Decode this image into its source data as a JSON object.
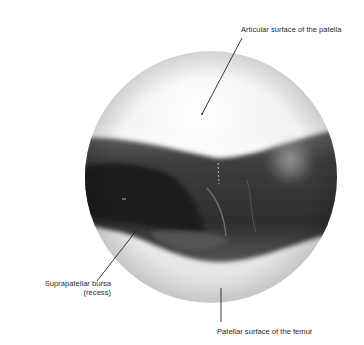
{
  "figure": {
    "type": "arthroscopic view",
    "labels": {
      "patella": "Articular surface of the patella",
      "bursa_line1": "Suprapatellar bursa",
      "bursa_line2": "(recess)",
      "femur": "Patellar surface of the femur"
    },
    "colors": {
      "background": "#ffffff",
      "cartilage": "#f2f2f2",
      "cavity_dark": "#2c2c2c",
      "synovium_mid": "#5a5a5a",
      "leader_line": "#222222",
      "label_text": "#2a2a2a"
    }
  }
}
